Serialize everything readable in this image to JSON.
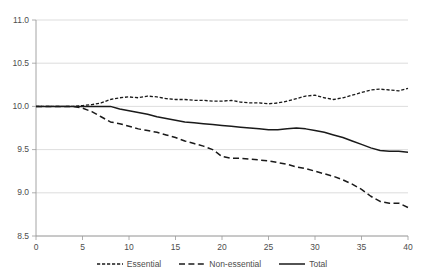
{
  "chart_data": {
    "type": "line",
    "title": "",
    "xlabel": "",
    "ylabel": "",
    "xlim": [
      0,
      40
    ],
    "ylim": [
      8.5,
      11.0
    ],
    "ytick_step": 0.5,
    "xtick_step": 5,
    "grid": "horizontal",
    "legend_position": "bottom",
    "xticks": [
      "0",
      "5",
      "10",
      "15",
      "20",
      "25",
      "30",
      "35",
      "40"
    ],
    "yticks": [
      "8.5",
      "9.0",
      "9.5",
      "10.0",
      "10.5",
      "11.0"
    ],
    "x": [
      0,
      1,
      2,
      3,
      4,
      5,
      6,
      7,
      8,
      9,
      10,
      11,
      12,
      13,
      14,
      15,
      16,
      17,
      18,
      19,
      20,
      21,
      22,
      23,
      24,
      25,
      26,
      27,
      28,
      29,
      30,
      31,
      32,
      33,
      34,
      35,
      36,
      37,
      38,
      39,
      40
    ],
    "series": [
      {
        "name": "Essential",
        "style": "fine-dashed",
        "color": "#1a1a1a",
        "values": [
          10.0,
          10.0,
          10.0,
          10.0,
          10.0,
          10.01,
          10.02,
          10.04,
          10.08,
          10.1,
          10.11,
          10.1,
          10.12,
          10.11,
          10.09,
          10.08,
          10.08,
          10.07,
          10.07,
          10.06,
          10.06,
          10.07,
          10.05,
          10.04,
          10.04,
          10.03,
          10.04,
          10.06,
          10.09,
          10.12,
          10.13,
          10.1,
          10.08,
          10.1,
          10.13,
          10.16,
          10.19,
          10.2,
          10.19,
          10.18,
          10.21
        ]
      },
      {
        "name": "Non-essential",
        "style": "long-dashed",
        "color": "#1a1a1a",
        "values": [
          10.0,
          10.0,
          10.0,
          10.0,
          10.0,
          9.98,
          9.94,
          9.88,
          9.82,
          9.8,
          9.77,
          9.74,
          9.72,
          9.7,
          9.67,
          9.64,
          9.6,
          9.57,
          9.54,
          9.5,
          9.42,
          9.4,
          9.4,
          9.39,
          9.38,
          9.37,
          9.35,
          9.33,
          9.3,
          9.28,
          9.25,
          9.22,
          9.19,
          9.15,
          9.1,
          9.04,
          8.96,
          8.9,
          8.88,
          8.88,
          8.83
        ]
      },
      {
        "name": "Total",
        "style": "solid",
        "color": "#1a1a1a",
        "values": [
          10.0,
          10.0,
          10.0,
          10.0,
          10.0,
          10.0,
          10.0,
          10.0,
          10.0,
          9.97,
          9.95,
          9.93,
          9.91,
          9.88,
          9.86,
          9.84,
          9.82,
          9.81,
          9.8,
          9.79,
          9.78,
          9.77,
          9.76,
          9.75,
          9.74,
          9.73,
          9.73,
          9.74,
          9.75,
          9.74,
          9.72,
          9.7,
          9.67,
          9.64,
          9.6,
          9.56,
          9.52,
          9.49,
          9.48,
          9.48,
          9.47
        ]
      }
    ]
  },
  "legend": {
    "items": [
      {
        "label": "Essential"
      },
      {
        "label": "Non-essential"
      },
      {
        "label": "Total"
      }
    ]
  }
}
